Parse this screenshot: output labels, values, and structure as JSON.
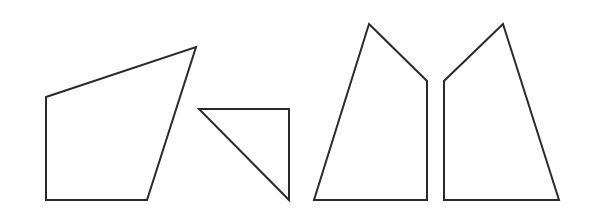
{
  "diagram": {
    "background": "#ffffff",
    "stroke_color": "#2a2a2a",
    "stroke_width": 2,
    "shapes": [
      {
        "name": "quadrilateral-left",
        "type": "quadrilateral",
        "points": "46,97 196,47 147,200 46,200"
      },
      {
        "name": "right-triangle",
        "type": "triangle",
        "points": "199,109 289,109 289,200"
      },
      {
        "name": "pentagon-left-half",
        "type": "quadrilateral",
        "points": "369,24 427,81 427,200 314,200"
      },
      {
        "name": "pentagon-right-half",
        "type": "quadrilateral",
        "points": "503,24 444,81 444,200 559,200"
      }
    ]
  }
}
